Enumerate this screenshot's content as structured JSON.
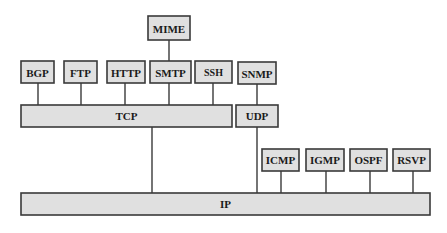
{
  "diagram": {
    "nodes": {
      "mime": "MIME",
      "bgp": "BGP",
      "ftp": "FTP",
      "http": "HTTP",
      "smtp": "SMTP",
      "ssh": "SSH",
      "snmp": "SNMP",
      "tcp": "TCP",
      "udp": "UDP",
      "icmp": "ICMP",
      "igmp": "IGMP",
      "ospf": "OSPF",
      "rsvp": "RSVP",
      "ip": "IP"
    },
    "edges": [
      [
        "MIME",
        "SMTP"
      ],
      [
        "BGP",
        "TCP"
      ],
      [
        "FTP",
        "TCP"
      ],
      [
        "HTTP",
        "TCP"
      ],
      [
        "SMTP",
        "TCP"
      ],
      [
        "SSH",
        "TCP"
      ],
      [
        "SNMP",
        "UDP"
      ],
      [
        "TCP",
        "IP"
      ],
      [
        "UDP",
        "IP"
      ],
      [
        "ICMP",
        "IP"
      ],
      [
        "IGMP",
        "IP"
      ],
      [
        "OSPF",
        "IP"
      ],
      [
        "RSVP",
        "IP"
      ]
    ]
  }
}
